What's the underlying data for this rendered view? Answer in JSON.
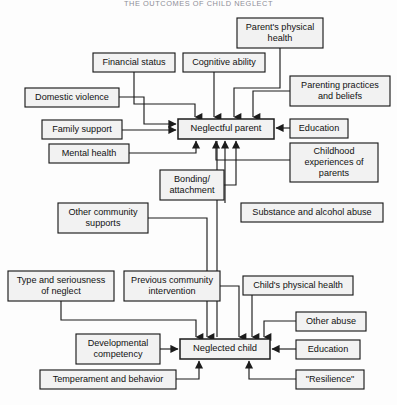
{
  "title": "THE OUTCOMES OF CHILD NEGLECT",
  "diagram": {
    "type": "flowchart",
    "orientation": "top-down",
    "style": {
      "box_fill": "#f2f2f2",
      "box_stroke": "#1c1c1c",
      "text_color": "#111111",
      "background": "#fdfdfd"
    },
    "nodes": [
      {
        "id": "parents_physical_health",
        "label": "Parent's physical health",
        "lines": [
          "Parent's physical",
          "health"
        ],
        "x": 237,
        "y": 18,
        "w": 86,
        "h": 30,
        "role": "factor"
      },
      {
        "id": "financial_status",
        "label": "Financial status",
        "lines": [
          "Financial status"
        ],
        "x": 93,
        "y": 53,
        "w": 82,
        "h": 19,
        "role": "factor"
      },
      {
        "id": "cognitive_ability",
        "label": "Cognitive ability",
        "lines": [
          "Cognitive ability"
        ],
        "x": 183,
        "y": 53,
        "w": 82,
        "h": 19,
        "role": "factor"
      },
      {
        "id": "parenting_practices",
        "label": "Parenting practices and beliefs",
        "lines": [
          "Parenting practices",
          "and beliefs"
        ],
        "x": 290,
        "y": 76,
        "w": 100,
        "h": 30,
        "role": "factor"
      },
      {
        "id": "domestic_violence",
        "label": "Domestic violence",
        "lines": [
          "Domestic violence"
        ],
        "x": 25,
        "y": 88,
        "w": 94,
        "h": 19,
        "role": "factor"
      },
      {
        "id": "family_support",
        "label": "Family support",
        "lines": [
          "Family support"
        ],
        "x": 42,
        "y": 120,
        "w": 80,
        "h": 19,
        "role": "factor"
      },
      {
        "id": "education_parent",
        "label": "Education",
        "lines": [
          "Education"
        ],
        "x": 290,
        "y": 119,
        "w": 58,
        "h": 19,
        "role": "factor"
      },
      {
        "id": "mental_health",
        "label": "Mental health",
        "lines": [
          "Mental health"
        ],
        "x": 49,
        "y": 144,
        "w": 80,
        "h": 19,
        "role": "factor"
      },
      {
        "id": "childhood_experiences",
        "label": "Childhood experiences of parents",
        "lines": [
          "Childhood",
          "experiences of",
          "parents"
        ],
        "x": 290,
        "y": 143,
        "w": 88,
        "h": 39,
        "role": "factor"
      },
      {
        "id": "neglectful_parent",
        "label": "Neglectful parent",
        "lines": [
          "Neglectful parent"
        ],
        "x": 178,
        "y": 119,
        "w": 96,
        "h": 20,
        "role": "outcome"
      },
      {
        "id": "bonding_attachment",
        "label": "Bonding/ attachment",
        "lines": [
          "Bonding/",
          "attachment"
        ],
        "x": 160,
        "y": 170,
        "w": 64,
        "h": 30,
        "role": "factor"
      },
      {
        "id": "other_community_supports",
        "label": "Other community supports",
        "lines": [
          "Other community",
          "supports"
        ],
        "x": 58,
        "y": 203,
        "w": 90,
        "h": 30,
        "role": "factor"
      },
      {
        "id": "substance_alcohol_abuse",
        "label": "Substance and alcohol abuse",
        "lines": [
          "Substance and alcohol abuse"
        ],
        "x": 241,
        "y": 203,
        "w": 142,
        "h": 19,
        "role": "factor"
      },
      {
        "id": "type_seriousness_neglect",
        "label": "Type and seriousness of neglect",
        "lines": [
          "Type and seriousness",
          "of neglect"
        ],
        "x": 8,
        "y": 271,
        "w": 106,
        "h": 30,
        "role": "factor"
      },
      {
        "id": "previous_community_intervention",
        "label": "Previous community intervention",
        "lines": [
          "Previous community",
          "intervention"
        ],
        "x": 124,
        "y": 271,
        "w": 96,
        "h": 30,
        "role": "factor"
      },
      {
        "id": "childs_physical_health",
        "label": "Child's physical health",
        "lines": [
          "Child's physical health"
        ],
        "x": 243,
        "y": 276,
        "w": 110,
        "h": 19,
        "role": "factor"
      },
      {
        "id": "other_abuse",
        "label": "Other abuse",
        "lines": [
          "Other abuse"
        ],
        "x": 296,
        "y": 312,
        "w": 70,
        "h": 19,
        "role": "factor"
      },
      {
        "id": "developmental_competency",
        "label": "Developmental competency",
        "lines": [
          "Developmental",
          "competency"
        ],
        "x": 76,
        "y": 334,
        "w": 84,
        "h": 30,
        "role": "factor"
      },
      {
        "id": "neglected_child",
        "label": "Neglected child",
        "lines": [
          "Neglected child"
        ],
        "x": 180,
        "y": 339,
        "w": 90,
        "h": 20,
        "role": "outcome"
      },
      {
        "id": "education_child",
        "label": "Education",
        "lines": [
          "Education"
        ],
        "x": 296,
        "y": 340,
        "w": 64,
        "h": 19,
        "role": "factor"
      },
      {
        "id": "temperament_behavior",
        "label": "Temperament and behavior",
        "lines": [
          "Temperament and behavior"
        ],
        "x": 40,
        "y": 370,
        "w": 136,
        "h": 19,
        "role": "factor"
      },
      {
        "id": "resilience",
        "label": "\"Resilience\"",
        "lines": [
          "\"Resilience\""
        ],
        "x": 296,
        "y": 370,
        "w": 68,
        "h": 19,
        "role": "factor"
      }
    ],
    "edges": [
      {
        "id": "e-financial-parent",
        "from": "financial_status",
        "to": "neglectful_parent",
        "points": "134,72 134,104 195,104 195,117",
        "arrow": "down"
      },
      {
        "id": "e-cognitive-parent",
        "from": "cognitive_ability",
        "to": "neglectful_parent",
        "points": "214,72 214,117",
        "arrow": "down"
      },
      {
        "id": "e-physical-parent",
        "from": "parents_physical_health",
        "to": "neglectful_parent",
        "points": "280,48 280,88 234,88 234,117",
        "arrow": "down"
      },
      {
        "id": "e-parenting-parent",
        "from": "parenting_practices",
        "to": "neglectful_parent",
        "points": "290,91 253,91 253,117",
        "arrow": "down"
      },
      {
        "id": "e-domestic-parent",
        "from": "domestic_violence",
        "to": "neglectful_parent",
        "points": "119,97 144,97 144,124 176,124",
        "arrow": "right"
      },
      {
        "id": "e-family-parent",
        "from": "family_support",
        "to": "neglectful_parent",
        "points": "122,130 176,130",
        "arrow": "right"
      },
      {
        "id": "e-education-parent",
        "from": "education_parent",
        "to": "neglectful_parent",
        "points": "290,128 276,128",
        "arrow": "left"
      },
      {
        "id": "e-mental-parent",
        "from": "mental_health",
        "to": "neglectful_parent",
        "points": "129,153 196,153 196,141",
        "arrow": "up"
      },
      {
        "id": "e-childhood-parent",
        "from": "childhood_experiences",
        "to": "neglectful_parent",
        "points": "290,160 216,160 216,141",
        "arrow": "up"
      },
      {
        "id": "e-bonding-parent",
        "from": "bonding_attachment",
        "to": "neglectful_parent",
        "points": "224,185 236,185 236,141",
        "arrow": "up"
      },
      {
        "id": "e-substance-parent",
        "from": "substance_alcohol_abuse",
        "to": "neglectful_parent",
        "points": "225,203 225,141",
        "arrow": "up"
      },
      {
        "id": "e-community-supports-child",
        "from": "other_community_supports",
        "to": "neglected_child",
        "points": "148,218 207,218 207,337",
        "arrow": "down"
      },
      {
        "id": "e-type-child",
        "from": "type_seriousness_neglect",
        "to": "neglected_child",
        "points": "61,301 61,320 196,320 196,337",
        "arrow": "down"
      },
      {
        "id": "e-previous-child",
        "from": "previous_community_intervention",
        "to": "neglected_child",
        "points": "220,286 239,286 239,337",
        "arrow": "down"
      },
      {
        "id": "e-childs-health-child",
        "from": "childs_physical_health",
        "to": "neglected_child",
        "points": "252,295 252,337",
        "arrow": "down"
      },
      {
        "id": "e-other-abuse-child",
        "from": "other_abuse",
        "to": "neglected_child",
        "points": "296,321 264,321 264,337",
        "arrow": "down"
      },
      {
        "id": "e-developmental-child",
        "from": "developmental_competency",
        "to": "neglected_child",
        "points": "160,349 178,349",
        "arrow": "right"
      },
      {
        "id": "e-education-child",
        "from": "education_child",
        "to": "neglected_child",
        "points": "296,349 272,349",
        "arrow": "left"
      },
      {
        "id": "e-temperament-child",
        "from": "temperament_behavior",
        "to": "neglected_child",
        "points": "176,379 199,379 199,361",
        "arrow": "up"
      },
      {
        "id": "e-resilience-child",
        "from": "resilience",
        "to": "neglected_child",
        "points": "296,379 249,379 249,361",
        "arrow": "up"
      },
      {
        "id": "e-child-to-parent",
        "from": "neglected_child",
        "to": "neglectful_parent",
        "points": "217,337 217,141",
        "arrow": "none"
      }
    ]
  }
}
